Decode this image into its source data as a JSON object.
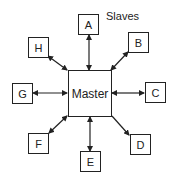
{
  "title": "Slaves",
  "master": {
    "label": "Master"
  },
  "slaves": [
    {
      "id": "A",
      "label": "A",
      "link": "bidirectional"
    },
    {
      "id": "B",
      "label": "B",
      "link": "bidirectional"
    },
    {
      "id": "C",
      "label": "C",
      "link": "bidirectional"
    },
    {
      "id": "D",
      "label": "D",
      "link": "master-to-slave"
    },
    {
      "id": "E",
      "label": "E",
      "link": "bidirectional"
    },
    {
      "id": "F",
      "label": "F",
      "link": "bidirectional"
    },
    {
      "id": "G",
      "label": "G",
      "link": "bidirectional"
    },
    {
      "id": "H",
      "label": "H",
      "link": "bidirectional"
    }
  ]
}
